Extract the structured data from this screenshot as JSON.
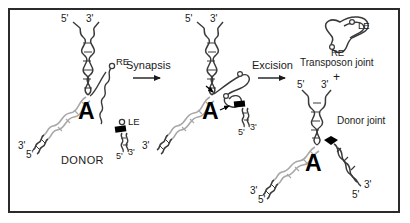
{
  "figure": {
    "title_text": "",
    "border_color": "#2b2b2b",
    "background_color": "#ffffff",
    "strand_dark_color": "#3a3a3a",
    "strand_light_color": "#a8a8a8",
    "protein_color": "#000000"
  },
  "steps": [
    {
      "id": "synapsis",
      "label": "Synapsis"
    },
    {
      "id": "excision",
      "label": "Excision"
    }
  ],
  "panel1": {
    "name": "donor",
    "center_letter": "A",
    "donor_label": "DONOR",
    "end_labels": {
      "top_left": "5'",
      "top_right": "3'",
      "left_lower": "3'",
      "left_lowest": "5'",
      "bottom_right_5": "5'",
      "bottom_right_3": "3'"
    },
    "element_labels": {
      "right_end": "RE",
      "left_end": "LE"
    }
  },
  "panel2": {
    "name": "synapsed-complex",
    "center_letter": "A",
    "end_labels": {
      "top_left": "5'",
      "top_right": "3'",
      "left_lower": "3'",
      "right_5": "5'",
      "right_3": "3'"
    }
  },
  "panel3": {
    "name": "excision-products",
    "center_letter": "A",
    "transposon_joint_label": "Transposon joint",
    "plus_label": "+",
    "donor_joint_label": "Donor joint",
    "element_labels": {
      "left_end": "LE",
      "right_end": "RE"
    },
    "end_labels": {
      "top_left": "5'",
      "top_right": "3'",
      "left_lower": "3'",
      "left_lowest": "5'",
      "right_3": "3'",
      "right_5": "5'"
    }
  }
}
